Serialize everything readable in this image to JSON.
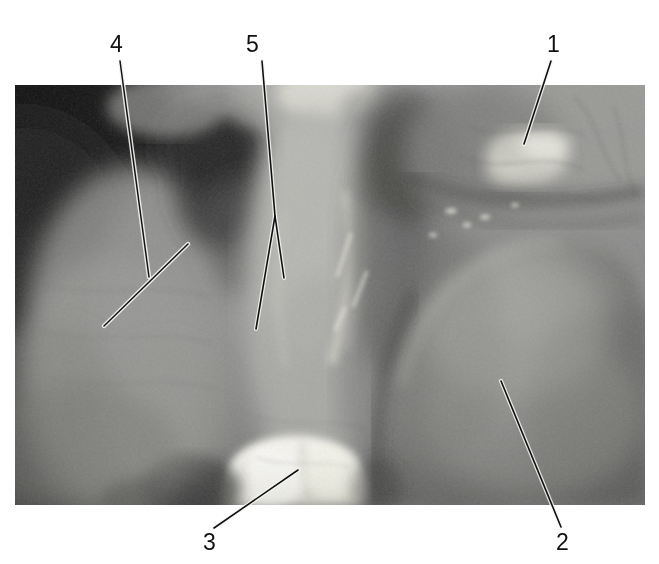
{
  "figure": {
    "kind": "annotated-anatomical-photograph",
    "width": 659,
    "height": 564,
    "background_color": "#ffffff",
    "photo": {
      "name": "grayscale-intraoral-photograph",
      "x": 15,
      "y": 85,
      "width": 630,
      "height": 420,
      "description": "Grayscale close-up photograph of oral mucosa and tooth surfaces",
      "tones": {
        "darkest": "#141414",
        "dark": "#3a3a3a",
        "mid": "#7d7d7d",
        "light": "#b4b4b4",
        "highlight": "#f0efe9"
      }
    },
    "callouts": [
      {
        "id": "callout-1",
        "label": "1",
        "label_x": 547,
        "label_y": 33,
        "line": [
          [
            551,
            61
          ],
          [
            524,
            144
          ]
        ]
      },
      {
        "id": "callout-2",
        "label": "2",
        "label_x": 556,
        "label_y": 531,
        "line": [
          [
            501,
            381
          ],
          [
            561,
            527
          ]
        ]
      },
      {
        "id": "callout-3",
        "label": "3",
        "label_x": 203,
        "label_y": 531,
        "line": [
          [
            298,
            470
          ],
          [
            214,
            528
          ]
        ]
      },
      {
        "id": "callout-4",
        "label": "4",
        "label_x": 110,
        "label_y": 33,
        "line": [
          [
            120,
            61
          ],
          [
            149,
            277
          ]
        ],
        "tick": [
          [
            104,
            326
          ],
          [
            188,
            244
          ]
        ]
      },
      {
        "id": "callout-5",
        "label": "5",
        "label_x": 246,
        "label_y": 33,
        "line": [
          [
            262,
            61
          ],
          [
            275,
            216
          ]
        ],
        "branch_left": [
          [
            275,
            216
          ],
          [
            256,
            329
          ]
        ],
        "branch_right": [
          [
            275,
            216
          ],
          [
            284,
            278
          ]
        ]
      }
    ],
    "leader_style": {
      "stroke": "#111111",
      "halo": "#f2f2f2",
      "width": 1.6,
      "halo_width": 4.2
    }
  }
}
